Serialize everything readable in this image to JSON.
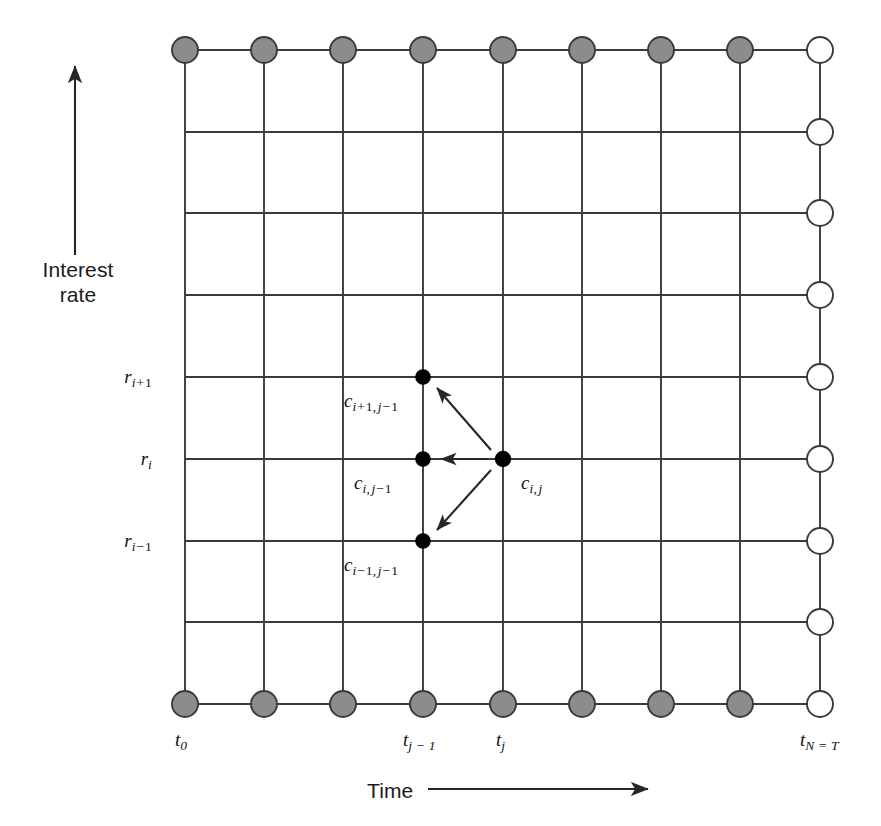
{
  "figure": {
    "type": "lattice-diagram",
    "background": "#ffffff",
    "line_color": "#3a3a3a",
    "shaded_node_fill": "#8c8c8c",
    "open_node_fill": "#ffffff",
    "solid_node_fill": "#000000"
  },
  "axes": {
    "y": {
      "label_line1": "Interest",
      "label_line2": "rate",
      "arrow": "up-arrow-icon"
    },
    "x": {
      "label": "Time",
      "arrow": "right-arrow-icon"
    }
  },
  "rate_ticks": [
    {
      "id": "r-i-plus-1",
      "base": "r",
      "sub_var": "i",
      "sub_op": "+",
      "sub_num": "1",
      "row": 4
    },
    {
      "id": "r-i",
      "base": "r",
      "sub_var": "i",
      "sub_op": "",
      "sub_num": "",
      "row": 5
    },
    {
      "id": "r-i-minus-1",
      "base": "r",
      "sub_var": "i",
      "sub_op": "−",
      "sub_num": "1",
      "row": 6
    }
  ],
  "time_ticks": [
    {
      "id": "t-0",
      "base": "t",
      "sub": "0",
      "col": 0
    },
    {
      "id": "t-j-minus-1",
      "base": "t",
      "sub": "j − 1",
      "col": 3
    },
    {
      "id": "t-j",
      "base": "t",
      "sub": "j",
      "col": 4
    },
    {
      "id": "t-N-eq-T",
      "base": "t",
      "sub": "N = T",
      "col": 8
    }
  ],
  "grid": {
    "columns": 9,
    "rows": 9,
    "x_positions": [
      185,
      264,
      343,
      423,
      503,
      582,
      661,
      740,
      820
    ],
    "y_positions": [
      50,
      132,
      213,
      295,
      377,
      459,
      541,
      622,
      704
    ],
    "top_row_index": 0,
    "bottom_row_index": 8
  },
  "nodes": {
    "shaded_top_count": 8,
    "shaded_bottom_count": 8,
    "open_right_count": 9,
    "shaded_radius": 13,
    "open_radius": 13,
    "solid_radius": 7.5
  },
  "cell_labels": [
    {
      "id": "c-i-plus-1-j-minus-1",
      "base": "c",
      "sub_i": "i",
      "sub_i_op": "+",
      "sub_i_num": "1",
      "sub_j": "j",
      "sub_j_op": "−",
      "sub_j_num": "1",
      "node_col": 3,
      "node_row": 4
    },
    {
      "id": "c-i-j-minus-1",
      "base": "c",
      "sub_i": "i",
      "sub_i_op": "",
      "sub_i_num": "",
      "sub_j": "j",
      "sub_j_op": "−",
      "sub_j_num": "1",
      "node_col": 3,
      "node_row": 5
    },
    {
      "id": "c-i-minus-1-j-minus-1",
      "base": "c",
      "sub_i": "i",
      "sub_i_op": "−",
      "sub_i_num": "1",
      "sub_j": "j",
      "sub_j_op": "−",
      "sub_j_num": "1",
      "node_col": 3,
      "node_row": 6
    },
    {
      "id": "c-i-j",
      "base": "c",
      "sub_i": "i",
      "sub_i_op": "",
      "sub_i_num": "",
      "sub_j": "j",
      "sub_j_op": "",
      "sub_j_num": "",
      "node_col": 4,
      "node_row": 5
    }
  ],
  "transition_arrows": [
    {
      "id": "arrow-up",
      "from": "c-i-j",
      "to": "c-i-plus-1-j-minus-1"
    },
    {
      "id": "arrow-middle",
      "from": "c-i-j",
      "to": "c-i-j-minus-1"
    },
    {
      "id": "arrow-down",
      "from": "c-i-j",
      "to": "c-i-minus-1-j-minus-1"
    }
  ]
}
